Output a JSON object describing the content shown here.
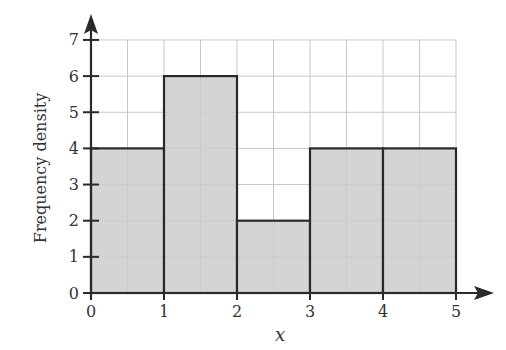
{
  "chart_data": {
    "type": "bar",
    "subtype": "histogram",
    "title": "",
    "xlabel": "x",
    "ylabel": "Frequency density",
    "xlim": [
      0,
      5
    ],
    "ylim": [
      0,
      7
    ],
    "x_ticks": [
      "0",
      "1",
      "2",
      "3",
      "4",
      "5"
    ],
    "y_ticks": [
      "0",
      "1",
      "2",
      "3",
      "4",
      "5",
      "6",
      "7"
    ],
    "grid": true,
    "grid_x_step": 0.5,
    "grid_y_step": 1,
    "legend": null,
    "bins": [
      {
        "from": 0,
        "to": 1,
        "value": 4
      },
      {
        "from": 1,
        "to": 2,
        "value": 6
      },
      {
        "from": 2,
        "to": 3,
        "value": 2
      },
      {
        "from": 3,
        "to": 4,
        "value": 4
      },
      {
        "from": 4,
        "to": 5,
        "value": 4
      }
    ],
    "categories": [
      "0-1",
      "1-2",
      "2-3",
      "3-4",
      "4-5"
    ],
    "values": [
      4,
      6,
      2,
      4,
      4
    ]
  },
  "colors": {
    "bar_fill": "#cdcdcd",
    "bar_stroke": "#2a2a2a",
    "grid": "#c8c8c8",
    "axis": "#2a2a2a",
    "text": "#333333"
  }
}
